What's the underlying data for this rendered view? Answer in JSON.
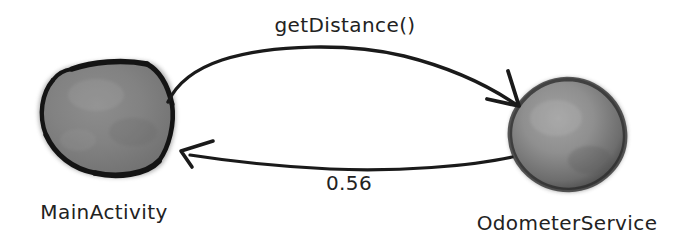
{
  "diagram": {
    "type": "sequence-interaction-sketch",
    "background_color": "#ffffff",
    "ink_color": "#1a1a1a",
    "nodes": [
      {
        "id": "main-activity",
        "label": "MainActivity",
        "shape": "hexagon",
        "fill_color": "#808080",
        "outline_color": "#1a1a1a",
        "center_x": 105,
        "center_y": 118,
        "label_x": 104,
        "label_y": 219
      },
      {
        "id": "odometer-service",
        "label": "OdometerService",
        "shape": "circle",
        "fill_color": "#8c8c8c",
        "outline_color": "#3a3a3a",
        "center_x": 567,
        "center_y": 134,
        "label_x": 567,
        "label_y": 230
      }
    ],
    "edges": [
      {
        "id": "call-edge",
        "label": "getDistance()",
        "from": "main-activity",
        "to": "odometer-service",
        "direction": "left-to-right",
        "curve": "arc-over-top",
        "label_x": 345,
        "label_y": 32
      },
      {
        "id": "return-edge",
        "label": "0.56",
        "from": "odometer-service",
        "to": "main-activity",
        "direction": "right-to-left",
        "curve": "arc-under-bottom",
        "label_x": 349,
        "label_y": 190
      }
    ]
  }
}
